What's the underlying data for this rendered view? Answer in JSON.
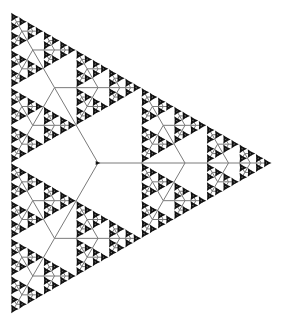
{
  "diagram": {
    "type": "ternary-fractal-arrow-tree",
    "background": "#ffffff",
    "line_color": "#7a7a7a",
    "arrow_color": "#111111",
    "line_width": 1,
    "root": {
      "x": 98,
      "y": 163
    },
    "root_length": 87,
    "scale_factor": 0.5,
    "depth": 6,
    "branch_angles_deg": [
      0,
      120,
      240
    ],
    "arrow_size": 4.2,
    "root_arrow_direction_deg": 0
  }
}
